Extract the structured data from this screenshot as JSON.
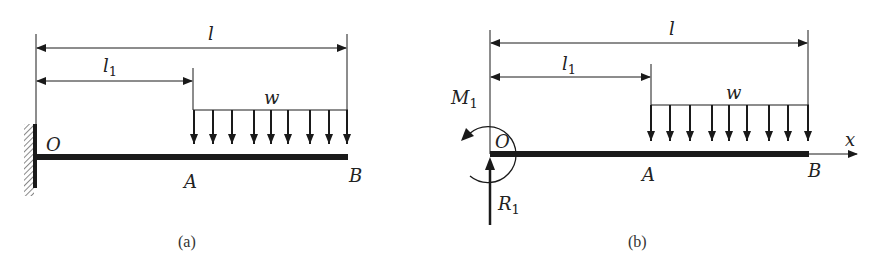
{
  "figure": {
    "colors": {
      "ink": "#1a1a1a",
      "background": "#ffffff",
      "hatch": "#555555"
    }
  },
  "panel_a": {
    "caption": "(a)",
    "labels": {
      "total_length": "l",
      "partial_length_main": "l",
      "partial_length_sub": "1",
      "load": "w",
      "fixed_end": "O",
      "load_start": "A",
      "free_end": "B"
    },
    "support": "fixed-wall",
    "load_arrow_count": 9
  },
  "panel_b": {
    "caption": "(b)",
    "labels": {
      "total_length": "l",
      "partial_length_main": "l",
      "partial_length_sub": "1",
      "load": "w",
      "origin": "O",
      "load_start": "A",
      "free_end": "B",
      "axis": "x",
      "moment_main": "M",
      "moment_sub": "1",
      "reaction_main": "R",
      "reaction_sub": "1"
    },
    "reactions": [
      "moment-counterclockwise",
      "vertical-force-up"
    ],
    "load_arrow_count": 9
  }
}
